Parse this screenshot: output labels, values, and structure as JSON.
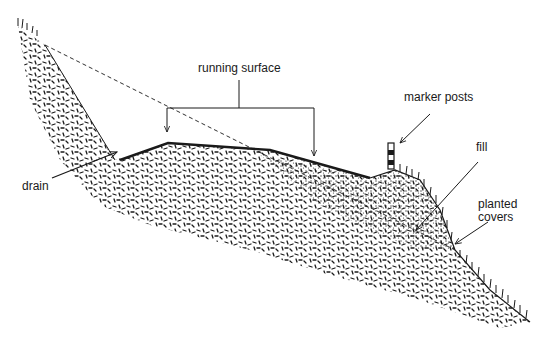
{
  "diagram": {
    "kind": "road cross-section on hillside",
    "colors": {
      "ink": "#1a1a1a",
      "background": "#ffffff"
    },
    "labels": {
      "running_surface": "running surface",
      "marker_posts": "marker posts",
      "fill": "fill",
      "drain": "drain",
      "planted_covers_line1": "planted",
      "planted_covers_line2": "covers"
    },
    "regions": [
      {
        "name": "natural-ground",
        "pattern": "random dashes"
      },
      {
        "name": "fill",
        "pattern": "stipple dots"
      },
      {
        "name": "original-slope-line",
        "style": "dashed"
      },
      {
        "name": "running-surface",
        "style": "thick solid line"
      },
      {
        "name": "vegetation",
        "style": "tufts on slopes"
      }
    ]
  }
}
